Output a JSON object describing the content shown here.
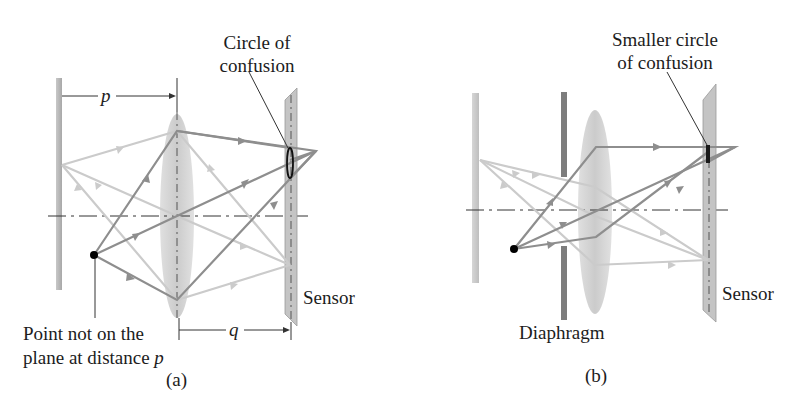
{
  "panels": [
    {
      "id": "a",
      "caption": "(a)",
      "callout_top": [
        "Circle of",
        "confusion"
      ],
      "distance_p_label": "p",
      "distance_q_label": "q",
      "sensor_label": "Sensor",
      "point_label_line1": "Point not on the",
      "point_label_line2": "plane at distance",
      "point_label_var": "p"
    },
    {
      "id": "b",
      "caption": "(b)",
      "callout_top": [
        "Smaller circle",
        "of confusion"
      ],
      "sensor_label": "Sensor",
      "diaphragm_label": "Diaphragm"
    }
  ],
  "colors": {
    "dark_ray": "#8a8a8a",
    "light_ray": "#c8c8c8",
    "lens_fill": "#cfcfcf",
    "sensor_fill": "#bdbdbd",
    "diaphragm": "#7a7a7a",
    "wall": "#b5b5b5",
    "point": "#000000"
  }
}
